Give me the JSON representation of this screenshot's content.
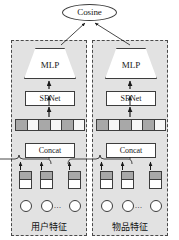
{
  "figure": {
    "type": "architecture-diagram",
    "background_color": "#ffffff",
    "panel_color": "#e2e2e2",
    "stroke_color": "#3d3d3d",
    "cell_dark_color": "#a8a8a8",
    "cell_light_color": "#f7f7f7"
  },
  "output": {
    "node_label": "Cosine",
    "shape": "ellipse"
  },
  "towers": [
    {
      "id": "user-tower",
      "side": "left",
      "caption": "用户特征",
      "mlp_label": "MLP",
      "senet_label": "SENet",
      "concat_label": "Concat",
      "embedding_cells": [
        "dark",
        "light",
        "dark",
        "light",
        "dark",
        "light"
      ],
      "feature_blocks": 3,
      "feature_circles": 3,
      "ellipsis": "..."
    },
    {
      "id": "item-tower",
      "side": "right",
      "caption": "物品特征",
      "mlp_label": "MLP",
      "senet_label": "SENet",
      "concat_label": "Concat",
      "embedding_cells": [
        "dark",
        "light",
        "dark",
        "light",
        "dark",
        "light"
      ],
      "feature_blocks": 3,
      "feature_circles": 3,
      "ellipsis": "..."
    }
  ]
}
